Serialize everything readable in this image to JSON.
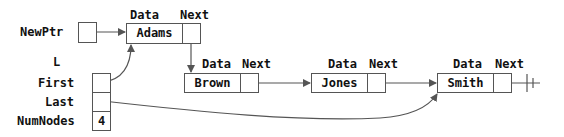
{
  "diagram": {
    "type": "linked-list",
    "pointer": {
      "label": "NewPtr"
    },
    "list_header": {
      "name": "L",
      "fields": [
        {
          "label": "First",
          "value": ""
        },
        {
          "label": "Last",
          "value": ""
        },
        {
          "label": "NumNodes",
          "value": "4"
        }
      ]
    },
    "field_headers": {
      "data": "Data",
      "next": "Next"
    },
    "nodes": [
      {
        "data": "Adams"
      },
      {
        "data": "Brown"
      },
      {
        "data": "Jones"
      },
      {
        "data": "Smith"
      }
    ],
    "null_terminator": "ground-symbol",
    "colors": {
      "line": "#555555",
      "text": "#111111",
      "background": "#ffffff"
    }
  }
}
